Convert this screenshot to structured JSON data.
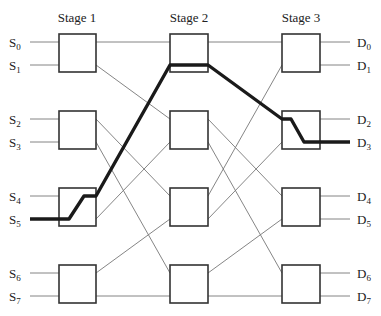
{
  "diagram": {
    "type": "multistage-switching-network",
    "stages": [
      {
        "label": "Stage 1",
        "x": 77
      },
      {
        "label": "Stage 2",
        "x": 189
      },
      {
        "label": "Stage 3",
        "x": 301
      }
    ],
    "inputs": [
      {
        "name": "S",
        "sub": "0"
      },
      {
        "name": "S",
        "sub": "1"
      },
      {
        "name": "S",
        "sub": "2"
      },
      {
        "name": "S",
        "sub": "3"
      },
      {
        "name": "S",
        "sub": "4"
      },
      {
        "name": "S",
        "sub": "5"
      },
      {
        "name": "S",
        "sub": "6"
      },
      {
        "name": "S",
        "sub": "7"
      }
    ],
    "outputs": [
      {
        "name": "D",
        "sub": "0"
      },
      {
        "name": "D",
        "sub": "1"
      },
      {
        "name": "D",
        "sub": "2"
      },
      {
        "name": "D",
        "sub": "3"
      },
      {
        "name": "D",
        "sub": "4"
      },
      {
        "name": "D",
        "sub": "5"
      },
      {
        "name": "D",
        "sub": "6"
      },
      {
        "name": "D",
        "sub": "7"
      }
    ],
    "highlighted_path": {
      "from": "S5",
      "to": "D3",
      "via": [
        "Stage 1 switch 3",
        "Stage 2 switch 1 (upper output)",
        "Stage 3 switch 2"
      ]
    },
    "colors": {
      "path": "#1a1a1a",
      "wire": "#777777",
      "box": "#333333"
    }
  }
}
